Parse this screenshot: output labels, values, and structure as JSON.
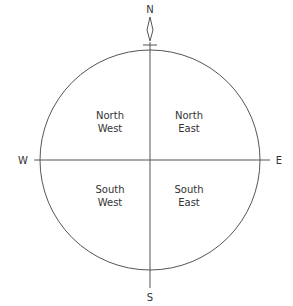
{
  "compass": {
    "north": "N",
    "south": "S",
    "east": "E",
    "west": "W"
  },
  "quadrants": {
    "nw": {
      "line1": "North",
      "line2": "West"
    },
    "ne": {
      "line1": "North",
      "line2": "East"
    },
    "sw": {
      "line1": "South",
      "line2": "West"
    },
    "se": {
      "line1": "South",
      "line2": "East"
    }
  },
  "colors": {
    "stroke": "#444444",
    "background": "#ffffff"
  }
}
